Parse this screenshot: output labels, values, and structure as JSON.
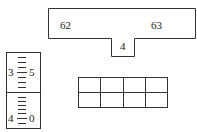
{
  "scale_figure": {
    "left_label": "62",
    "right_label": "63",
    "pointer_label": "4"
  },
  "gauge": {
    "upper": {
      "left_label": "3",
      "right_label": "5"
    },
    "lower": {
      "left_label": "4",
      "right_label": "0"
    }
  },
  "grid": {
    "rows": 2,
    "cols": 4
  }
}
